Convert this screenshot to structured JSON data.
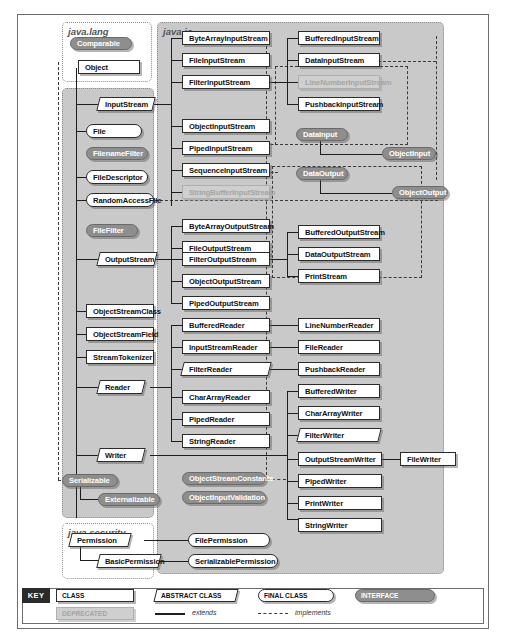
{
  "diagram": {
    "packages": [
      {
        "name": "java.lang",
        "type": "package-label"
      },
      {
        "name": "java.io",
        "type": "package-label"
      },
      {
        "name": "java.security",
        "type": "package-label"
      }
    ]
  },
  "nodes": {
    "comparable": "Comparable",
    "object": "Object",
    "inputstream": "InputStream",
    "file": "File",
    "filenamefilter": "FilenameFilter",
    "filedescriptor": "FileDescriptor",
    "randomaccessfile": "RandomAccessFile",
    "filefilter": "FileFilter",
    "outputstream": "OutputStream",
    "objectstreamclass": "ObjectStreamClass",
    "objectstreamfield": "ObjectStreamField",
    "streamtokenizer": "StreamTokenizer",
    "reader": "Reader",
    "writer": "Writer",
    "serializable": "Serializable",
    "externalizable": "Externalizable",
    "bytearrayinputstream": "ByteArrayInputStream",
    "fileinputstream": "FileInputStream",
    "filterinputstream": "FilterInputStream",
    "objectinputstream": "ObjectInputStream",
    "pipedinputstream": "PipedInputStream",
    "sequenceinputstream": "SequenceInputStream",
    "stringbufferinputstream": "StringBufferInputStream",
    "bytearrayoutputstream": "ByteArrayOutputStream",
    "fileoutputstream": "FileOutputStream",
    "filteroutputstream": "FilterOutputStream",
    "objectoutputstream": "ObjectOutputStream",
    "pipedoutputstream": "PipedOutputStream",
    "bufferedreader": "BufferedReader",
    "inputstreamreader": "InputStreamReader",
    "filterreader": "FilterReader",
    "chararrayreader": "CharArrayReader",
    "pipedreader": "PipedReader",
    "stringreader": "StringReader",
    "objectstreamconstants": "ObjectStreamConstants",
    "objectinputvalidation": "ObjectInputValidation",
    "bufferedinputstream": "BufferedInputStream",
    "datainputstream": "DataInputStream",
    "linenumberinputstream": "LineNumberInputStream",
    "pushbackinputstream": "PushbackInputStream",
    "datainput": "DataInput",
    "dataoutput": "DataOutput",
    "objectinput": "ObjectInput",
    "objectoutput": "ObjectOutput",
    "bufferedoutputstream": "BufferedOutputStream",
    "dataoutputstream": "DataOutputStream",
    "printstream": "PrintStream",
    "linenumberreader": "LineNumberReader",
    "filereader": "FileReader",
    "pushbackreader": "PushbackReader",
    "bufferedwriter": "BufferedWriter",
    "chararraywriter": "CharArrayWriter",
    "filterwriter": "FilterWriter",
    "outputstreamwriter": "OutputStreamWriter",
    "pipedwriter": "PipedWriter",
    "printwriter": "PrintWriter",
    "stringwriter": "StringWriter",
    "filewriter": "FileWriter",
    "permission": "Permission",
    "basicpermission": "BasicPermission",
    "filepermission": "FilePermission",
    "serializablepermission": "SerializablePermission"
  },
  "key": {
    "tag": "KEY",
    "class_label": "CLASS",
    "abstract_label": "ABSTRACT CLASS",
    "final_label": "FINAL CLASS",
    "interface_label": "INTERFACE",
    "deprecated_label": "DEPRECATED",
    "extends_label": "extends",
    "implements_label": "implements"
  },
  "colors": {
    "package_io_fill": "#c9c9c9",
    "interface_fill": "#8e8e8e",
    "class_fill": "#ffffff",
    "deprecated_fill": "#cfcfcf",
    "border": "#2b2b2b",
    "key_tag_bg": "#2b2b2b"
  }
}
